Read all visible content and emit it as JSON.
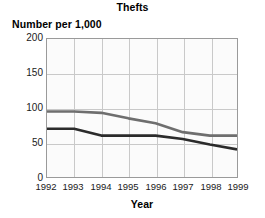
{
  "chart_data": {
    "type": "line",
    "title": "Thefts",
    "ylabel": "Number per 1,000",
    "xlabel": "Year",
    "categories": [
      "1992",
      "1993",
      "1994",
      "1995",
      "1996",
      "1997",
      "1998",
      "1999"
    ],
    "x": [
      1992,
      1993,
      1994,
      1995,
      1996,
      1997,
      1998,
      1999
    ],
    "ylim": [
      0,
      200
    ],
    "xlim": [
      1992,
      1999
    ],
    "yticks": [
      0,
      50,
      100,
      150,
      200
    ],
    "ytick_labels": [
      "0",
      "50",
      "100",
      "150",
      "200"
    ],
    "grid": true,
    "legend": "none",
    "series": [
      {
        "name": "series-gray",
        "color": "#6e6e6e",
        "values": [
          95,
          95,
          93,
          85,
          78,
          65,
          60,
          60
        ]
      },
      {
        "name": "series-dark",
        "color": "#2b2b2b",
        "values": [
          70,
          70,
          60,
          60,
          60,
          55,
          47,
          40
        ]
      }
    ],
    "annotations": []
  },
  "colors": {
    "frame": "#9a9a9a",
    "grid": "#c9c9c9",
    "plot_background": "#fbfbfb",
    "text": "#000000"
  }
}
